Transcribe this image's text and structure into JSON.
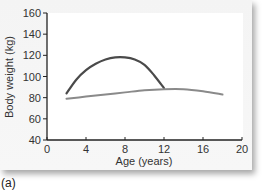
{
  "chart_data": {
    "type": "line",
    "title": "",
    "xlabel": "Age (years)",
    "ylabel": "Body weight (kg)",
    "xlim": [
      0,
      20
    ],
    "ylim": [
      40,
      160
    ],
    "xticks": [
      0,
      4,
      8,
      12,
      16,
      20
    ],
    "yticks": [
      40,
      60,
      80,
      100,
      120,
      140,
      160
    ],
    "grid": false,
    "legend": null,
    "series": [
      {
        "name": "dark curve",
        "color": "#4a4a4a",
        "x": [
          2,
          3,
          4,
          5,
          6,
          7,
          8,
          9,
          10,
          11,
          12
        ],
        "y": [
          84,
          97,
          106,
          112,
          116,
          118,
          118,
          116,
          111,
          101,
          89
        ]
      },
      {
        "name": "light curve",
        "color": "#8a8a8a",
        "x": [
          2,
          4,
          6,
          8,
          10,
          12,
          14,
          16,
          18
        ],
        "y": [
          79,
          81,
          83,
          85,
          87,
          88,
          88,
          86,
          83
        ]
      }
    ],
    "panel_label": "(a)"
  }
}
